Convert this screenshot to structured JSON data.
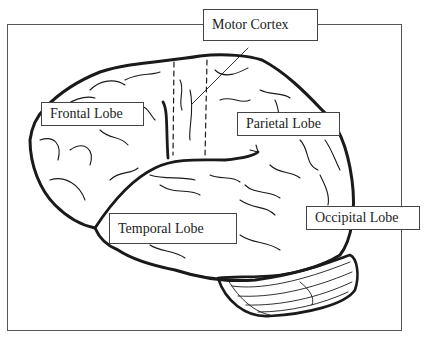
{
  "diagram": {
    "type": "labeled-illustration",
    "labels": {
      "motor_cortex": "Motor Cortex",
      "frontal_lobe": "Frontal Lobe",
      "parietal_lobe": "Parietal Lobe",
      "temporal_lobe": "Temporal Lobe",
      "occipital_lobe": "Occipital Lobe"
    },
    "colors": {
      "stroke": "#1a1a1a",
      "frame": "#555555",
      "background": "#ffffff"
    }
  }
}
